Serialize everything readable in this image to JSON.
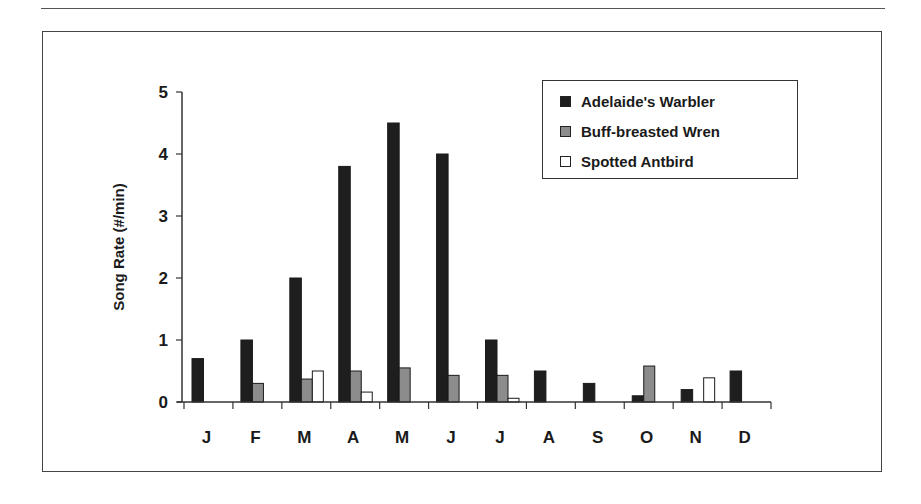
{
  "chart_data": {
    "type": "bar",
    "title": "",
    "xlabel": "",
    "ylabel": "Song Rate (#/min)",
    "ylim": [
      0,
      5
    ],
    "yticks": [
      "0",
      "1",
      "2",
      "3",
      "4",
      "5"
    ],
    "grid": false,
    "legend_position": "upper-right (inside)",
    "categories": [
      "J",
      "F",
      "M",
      "A",
      "M",
      "J",
      "J",
      "A",
      "S",
      "O",
      "N",
      "D"
    ],
    "series": [
      {
        "name": "Adelaide's Warbler",
        "color": "#1e1e1e",
        "values": [
          0.7,
          1.0,
          2.0,
          3.8,
          4.5,
          4.0,
          1.0,
          0.5,
          0.3,
          0.1,
          0.2,
          0.5
        ]
      },
      {
        "name": "Buff-breasted Wren",
        "color": "#8c8c8c",
        "values": [
          0,
          0.3,
          0.37,
          0.5,
          0.55,
          0.43,
          0.43,
          0,
          0,
          0.58,
          0,
          0
        ]
      },
      {
        "name": "Spotted Antbird",
        "color": "#ffffff",
        "values": [
          0,
          0,
          0.5,
          0.16,
          0,
          0,
          0.06,
          0,
          0,
          0,
          0.39,
          0
        ]
      }
    ]
  },
  "legend": {
    "items": [
      {
        "label": "Adelaide's Warbler",
        "swatch": "#1e1e1e"
      },
      {
        "label": "Buff-breasted Wren",
        "swatch": "#8c8c8c"
      },
      {
        "label": "Spotted Antbird",
        "swatch": "#ffffff"
      }
    ]
  }
}
